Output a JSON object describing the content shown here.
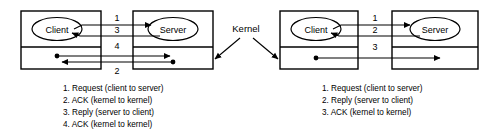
{
  "diagram": {
    "kernel_label": "Kernel",
    "colors": {
      "stroke": "#000000",
      "background": "#ffffff",
      "text": "#000000"
    },
    "panels": [
      {
        "id": "left-panel",
        "name": "four-message-protocol",
        "client_box": {
          "user_label": "Client",
          "kernel_band": true
        },
        "server_box": {
          "user_label": "Server",
          "kernel_band": true
        },
        "arrows": [
          {
            "number": "1",
            "direction": "left-to-right",
            "origin": "client-user",
            "target": "server-user",
            "dot_origin": false
          },
          {
            "number": "3",
            "direction": "right-to-left",
            "origin": "server-user",
            "target": "client-user",
            "dot_origin": false
          },
          {
            "number": "4",
            "direction": "left-to-right",
            "origin": "client-kernel",
            "target": "server-kernel",
            "dot_origin": true
          },
          {
            "number": "2",
            "direction": "right-to-left",
            "origin": "server-kernel",
            "target": "client-kernel",
            "dot_origin": true
          }
        ],
        "legend": [
          "1. Request (client to server)",
          "2. ACK (kernel to kernel)",
          "3. Reply (server to client)",
          "4. ACK (kernel to kernel)"
        ]
      },
      {
        "id": "right-panel",
        "name": "three-message-protocol",
        "client_box": {
          "user_label": "Client",
          "kernel_band": true
        },
        "server_box": {
          "user_label": "Server",
          "kernel_band": true
        },
        "arrows": [
          {
            "number": "1",
            "direction": "left-to-right",
            "origin": "client-user",
            "target": "server-user",
            "dot_origin": false
          },
          {
            "number": "2",
            "direction": "right-to-left",
            "origin": "server-user",
            "target": "client-user",
            "dot_origin": false
          },
          {
            "number": "3",
            "direction": "left-to-right",
            "origin": "client-kernel",
            "target": "server-kernel",
            "dot_origin": true
          }
        ],
        "legend": [
          "1. Request (client to server)",
          "2. Reply (server to client)",
          "3. ACK (kernel to kernel)"
        ]
      }
    ]
  }
}
